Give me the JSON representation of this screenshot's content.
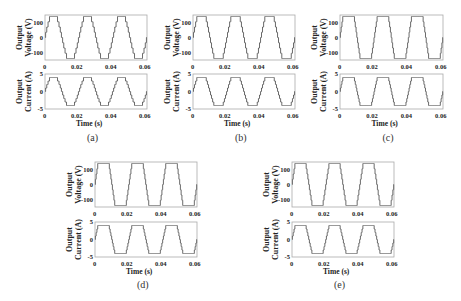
{
  "chart_data": [
    {
      "type": "line",
      "panel": "(a)",
      "subplots": [
        {
          "ylabel": "Output Voltage (V)",
          "yticks": [
            "100",
            "0",
            "-100"
          ],
          "ylim": [
            -150,
            150
          ],
          "amplitude": 140,
          "levels": 4,
          "flat_top_fraction": 0.03
        },
        {
          "ylabel": "Output Current (A)",
          "yticks": [
            "5",
            "0",
            "-5"
          ],
          "ylim": [
            -5,
            5
          ],
          "amplitude": 4,
          "levels": 4,
          "flat_top_fraction": 0.03
        }
      ],
      "xlabel": "Time (s)",
      "xticks": [
        "0",
        "0.02",
        "0.04",
        "0.06"
      ],
      "xlim": [
        0,
        0.06
      ],
      "frequency_hz": 50,
      "waveform": "staircase sine (multilevel inverter)"
    },
    {
      "type": "line",
      "panel": "(b)",
      "subplots": [
        {
          "ylabel": "Output Voltage (V)",
          "yticks": [
            "100",
            "0",
            "-100"
          ],
          "ylim": [
            -150,
            150
          ],
          "amplitude": 140,
          "levels": 4,
          "flat_top_fraction": 0.06
        },
        {
          "ylabel": "Output Current (A)",
          "yticks": [
            "5",
            "0",
            "-5"
          ],
          "ylim": [
            -5,
            5
          ],
          "amplitude": 4,
          "levels": 4,
          "flat_top_fraction": 0.06
        }
      ],
      "xlabel": "Time (s)",
      "xticks": [
        "0",
        "0.02",
        "0.04",
        "0.06"
      ],
      "xlim": [
        0,
        0.06
      ],
      "frequency_hz": 50,
      "waveform": "staircase sine (multilevel inverter)"
    },
    {
      "type": "line",
      "panel": "(c)",
      "subplots": [
        {
          "ylabel": "Output Voltage (V)",
          "yticks": [
            "100",
            "0",
            "-100"
          ],
          "ylim": [
            -150,
            150
          ],
          "amplitude": 140,
          "levels": 4,
          "flat_top_fraction": 0.14
        },
        {
          "ylabel": "Output Current (A)",
          "yticks": [
            "5",
            "0",
            "-5"
          ],
          "ylim": [
            -5,
            5
          ],
          "amplitude": 4,
          "levels": 4,
          "flat_top_fraction": 0.14
        }
      ],
      "xlabel": "Time (s)",
      "xticks": [
        "0",
        "0.02",
        "0.04",
        "0.06"
      ],
      "xlim": [
        0,
        0.06
      ],
      "frequency_hz": 50,
      "waveform": "staircase sine (multilevel inverter)"
    },
    {
      "type": "line",
      "panel": "(d)",
      "subplots": [
        {
          "ylabel": "Output Voltage (V)",
          "yticks": [
            "100",
            "0",
            "-100"
          ],
          "ylim": [
            -150,
            150
          ],
          "amplitude": 140,
          "levels": 4,
          "flat_top_fraction": 0.14
        },
        {
          "ylabel": "Output Current (A)",
          "yticks": [
            "5",
            "0",
            "-5"
          ],
          "ylim": [
            -5,
            5
          ],
          "amplitude": 4,
          "levels": 4,
          "flat_top_fraction": 0.14
        }
      ],
      "xlabel": "Time (s)",
      "xticks": [
        "0",
        "0.02",
        "0.04",
        "0.06"
      ],
      "xlim": [
        0,
        0.06
      ],
      "frequency_hz": 50,
      "waveform": "staircase sine (multilevel inverter)"
    },
    {
      "type": "line",
      "panel": "(e)",
      "subplots": [
        {
          "ylabel": "Output Voltage (V)",
          "yticks": [
            "100",
            "0",
            "-100"
          ],
          "ylim": [
            -150,
            150
          ],
          "amplitude": 140,
          "levels": 4,
          "flat_top_fraction": 0.12
        },
        {
          "ylabel": "Output Current (A)",
          "yticks": [
            "5",
            "0",
            "-5"
          ],
          "ylim": [
            -5,
            5
          ],
          "amplitude": 4,
          "levels": 4,
          "flat_top_fraction": 0.12
        }
      ],
      "xlabel": "Time (s)",
      "xticks": [
        "0",
        "0.02",
        "0.04",
        "0.06"
      ],
      "xlim": [
        0,
        0.06
      ],
      "frequency_hz": 50,
      "waveform": "staircase sine (multilevel inverter)"
    }
  ],
  "labels": {
    "voltage_line1": "Output",
    "voltage_line2": "Voltage (V)",
    "current_line1": "Output",
    "current_line2": "Current (A)",
    "xlabel": "Time (s)",
    "vticks": [
      "100",
      "0",
      "-100"
    ],
    "iticks": [
      "5",
      "0",
      "-5"
    ],
    "xticks": [
      "0",
      "0.02",
      "0.04",
      "0.06"
    ],
    "captions": [
      "(a)",
      "(b)",
      "(c)",
      "(d)",
      "(e)"
    ]
  },
  "style": {
    "line_color": "#6a6a6a",
    "axis_color": "#aaaaaa"
  }
}
